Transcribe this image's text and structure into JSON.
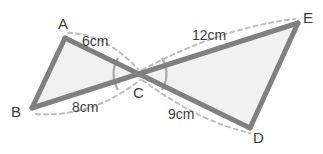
{
  "figure": {
    "stroke_color": "#808080",
    "fill_color": "#f1f1f1",
    "dash_color": "#bdbdbd",
    "arc_color": "#a8a8a8",
    "label_color": "#3c3c3c",
    "background": "#ffffff"
  },
  "vertices": {
    "A": {
      "label": "A",
      "x": 65,
      "y": 38
    },
    "B": {
      "label": "B",
      "x": 32,
      "y": 108
    },
    "C": {
      "label": "C",
      "x": 140,
      "y": 74
    },
    "D": {
      "label": "D",
      "x": 250,
      "y": 128
    },
    "E": {
      "label": "E",
      "x": 298,
      "y": 23
    }
  },
  "measurements": {
    "AC": {
      "label": "6cm",
      "value": 6,
      "unit": "cm",
      "from": "A",
      "to": "C"
    },
    "BC": {
      "label": "8cm",
      "value": 8,
      "unit": "cm",
      "from": "B",
      "to": "C"
    },
    "CE": {
      "label": "12cm",
      "value": 12,
      "unit": "cm",
      "from": "C",
      "to": "E"
    },
    "CD": {
      "label": "9cm",
      "value": 9,
      "unit": "cm",
      "from": "C",
      "to": "D"
    }
  },
  "angle_marks": [
    {
      "name": "angle-ACB",
      "at": "C",
      "between": [
        "A",
        "B"
      ]
    },
    {
      "name": "angle-ECD",
      "at": "C",
      "between": [
        "E",
        "D"
      ]
    }
  ]
}
